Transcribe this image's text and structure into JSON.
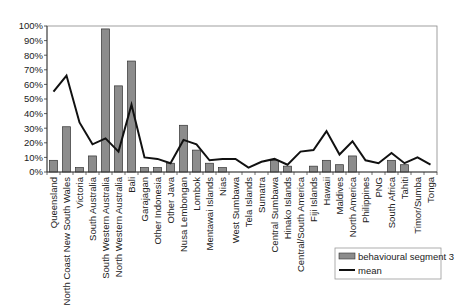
{
  "chart_data": {
    "type": "bar+line",
    "title": "",
    "xlabel": "",
    "ylabel": "",
    "ylim": [
      0,
      100
    ],
    "y_tick_labels": [
      "0%",
      "10%",
      "20%",
      "30%",
      "40%",
      "50%",
      "60%",
      "70%",
      "80%",
      "90%",
      "100%"
    ],
    "grid": false,
    "legend_position": "lower right",
    "categories": [
      "Queensland",
      "North Coast New South Wales",
      "Victoria",
      "South Australia",
      "South Western Australia",
      "North Western Australia",
      "Bali",
      "Garajagan",
      "Other Indonesia",
      "Other Java",
      "Nusa Lembongan",
      "Lombok",
      "Mentawai Islands",
      "Nias",
      "West Sumbawa",
      "Tela Islands",
      "Sumatra",
      "Central Sumbawa",
      "Hinako Islands",
      "Central/South America",
      "Fiji Islands",
      "Hawaii",
      "Maldives",
      "North America",
      "Philippines",
      "PNG",
      "South Africa",
      "Tahiti",
      "Timor/Sumba",
      "Tonga"
    ],
    "series": [
      {
        "name": "behavioural segment 3",
        "type": "bar",
        "color": "#8c8c8c",
        "values": [
          8,
          31,
          3,
          11,
          98,
          59,
          76,
          3,
          3,
          6,
          32,
          15,
          6,
          3,
          0,
          0,
          0,
          8,
          4,
          0,
          4,
          8,
          5,
          11,
          0,
          0,
          8,
          5,
          0,
          0
        ]
      },
      {
        "name": "mean",
        "type": "line",
        "color": "#111111",
        "values": [
          55,
          66,
          34,
          19,
          23,
          14,
          46,
          10,
          9,
          6,
          22,
          19,
          8,
          9,
          9,
          3,
          7,
          9,
          5,
          14,
          15,
          28,
          12,
          21,
          8,
          6,
          13,
          6,
          10,
          5
        ]
      }
    ]
  },
  "legend": {
    "items": [
      {
        "label": "behavioural segment 3",
        "swatch": "bar"
      },
      {
        "label": "mean",
        "swatch": "line"
      }
    ]
  }
}
